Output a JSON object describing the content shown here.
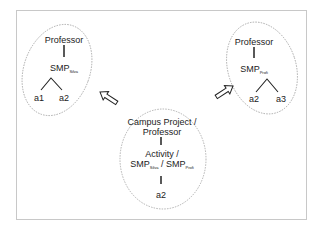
{
  "diagram": {
    "type": "hierarchy-merge",
    "colors": {
      "ellipse_stroke": "#a0a0a0",
      "line": "#222222",
      "frame": "#c8c8c8"
    },
    "left_tree": {
      "root": "Professor",
      "middle": {
        "base": "SMP",
        "sub": "Silva"
      },
      "leaves": [
        "a1",
        "a2"
      ]
    },
    "right_tree": {
      "root": "Professor",
      "middle": {
        "base": "SMP",
        "sub": "Profi"
      },
      "leaves": [
        "a2",
        "a3"
      ]
    },
    "center_tree": {
      "root_line1": "Campus Project /",
      "root_line2": "Professor",
      "middle_line1": "Activity /",
      "middle_a": {
        "base": "SMP",
        "sub": "Silva"
      },
      "middle_sep": "/",
      "middle_b": {
        "base": "SMP",
        "sub": "Profi"
      },
      "leaf": "a2"
    },
    "arrows": [
      {
        "from": "center_tree",
        "to": "left_tree",
        "icon": "hollow-arrow-icon"
      },
      {
        "from": "center_tree",
        "to": "right_tree",
        "icon": "hollow-arrow-icon"
      }
    ]
  }
}
